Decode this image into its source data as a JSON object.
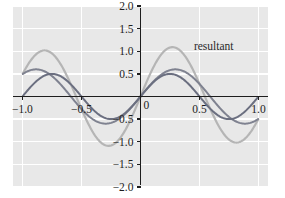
{
  "chart_data": {
    "type": "line",
    "title": "",
    "xlabel": "",
    "ylabel": "",
    "xlim": [
      -1.08,
      1.08
    ],
    "ylim": [
      -2.0,
      2.0
    ],
    "grid": true,
    "grid_color": "#ffffff",
    "background_color": "#e8e8e8",
    "axis_color": "#1d1d1d",
    "legend_position": "annotation-inside-top-right",
    "xticks": [
      -1.0,
      -0.5,
      0.5,
      1.0
    ],
    "xtick_labels": [
      "-1.0",
      "-0.5",
      "0.5",
      "1.0"
    ],
    "yticks": [
      -2.0,
      -1.5,
      -1.0,
      -0.5,
      0.5,
      1.0,
      1.5,
      2.0
    ],
    "ytick_labels": [
      "-2.0",
      "-1.5",
      "-1.0",
      "-0.5",
      "0.5",
      "1.0",
      "1.5",
      "2.0"
    ],
    "origin_label": "0",
    "annotations": [
      {
        "text": "resultant",
        "x": 0.62,
        "y": 1.02,
        "color": "#2a2a2a"
      }
    ],
    "series": [
      {
        "name": "wave-1",
        "color": "#6b6f80",
        "linewidth": 2.0,
        "amplitude": 0.5,
        "period": 1.0,
        "phase": 0.0,
        "formula": "0.5*sin(2*pi*x)",
        "x": [
          -1.0,
          -0.9,
          -0.8,
          -0.75,
          -0.7,
          -0.6,
          -0.5,
          -0.4,
          -0.3,
          -0.25,
          -0.2,
          -0.1,
          0.0,
          0.1,
          0.2,
          0.25,
          0.3,
          0.4,
          0.5,
          0.6,
          0.7,
          0.75,
          0.8,
          0.9,
          1.0
        ],
        "y": [
          0.0,
          0.294,
          0.476,
          0.5,
          0.476,
          0.294,
          0.0,
          -0.294,
          -0.476,
          -0.5,
          -0.476,
          -0.294,
          0.0,
          0.294,
          0.476,
          0.5,
          0.476,
          0.294,
          0.0,
          -0.294,
          -0.476,
          -0.5,
          -0.476,
          -0.294,
          0.0
        ]
      },
      {
        "name": "wave-2",
        "color": "#7f8290",
        "linewidth": 2.0,
        "amplitude": 0.6,
        "period": 1.18,
        "phase": 0.0,
        "formula": "0.6*sin(2*pi*x/1.18)",
        "x": [
          -1.0,
          -0.9,
          -0.8,
          -0.7,
          -0.6,
          -0.5,
          -0.4,
          -0.3,
          -0.2,
          -0.1,
          0.0,
          0.1,
          0.2,
          0.3,
          0.4,
          0.5,
          0.6,
          0.7,
          0.8,
          0.9,
          1.0
        ],
        "y": [
          -0.253,
          -0.446,
          -0.565,
          -0.598,
          -0.541,
          -0.407,
          -0.216,
          0.0,
          0.216,
          0.407,
          0.541,
          0.598,
          0.565,
          0.446,
          0.253,
          0.0,
          -0.253,
          -0.446,
          -0.565,
          -0.598,
          -0.541
        ]
      },
      {
        "name": "resultant",
        "color": "#b5b5b5",
        "linewidth": 2.2,
        "amplitude": 1.0,
        "formula": "wave-1 + wave-2",
        "x": [
          -1.0,
          -0.9,
          -0.8,
          -0.7,
          -0.6,
          -0.5,
          -0.4,
          -0.3,
          -0.2,
          -0.1,
          0.0,
          0.1,
          0.2,
          0.3,
          0.4,
          0.5,
          0.6,
          0.7,
          0.8,
          0.9,
          1.0
        ],
        "y": [
          -0.253,
          -0.152,
          -0.089,
          -0.182,
          -0.247,
          -0.407,
          -0.51,
          -0.476,
          -0.26,
          0.113,
          0.541,
          0.892,
          1.041,
          0.922,
          0.547,
          0.0,
          -0.547,
          -0.922,
          -1.041,
          -0.892,
          -0.541
        ]
      }
    ]
  }
}
